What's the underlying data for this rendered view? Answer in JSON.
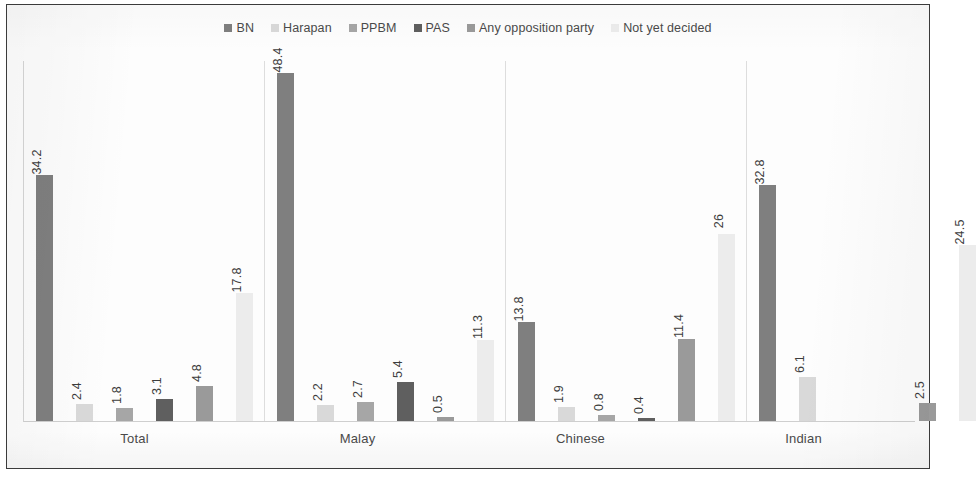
{
  "chart_data": {
    "type": "bar",
    "title": "",
    "subtitle": "",
    "xlabel": "",
    "ylabel": "",
    "grid": false,
    "legend_position": "top",
    "ylim": [
      0,
      50
    ],
    "categories": [
      "Total",
      "Malay",
      "Chinese",
      "Indian"
    ],
    "series": [
      {
        "name": "BN",
        "color": "#7f7f7f",
        "values": [
          34.2,
          48.4,
          13.8,
          32.8
        ]
      },
      {
        "name": "Harapan",
        "color": "#d9d9d9",
        "values": [
          2.4,
          2.2,
          1.9,
          6.1
        ]
      },
      {
        "name": "PPBM",
        "color": "#a6a6a6",
        "values": [
          1.8,
          2.7,
          0.8,
          0
        ]
      },
      {
        "name": "PAS",
        "color": "#5f5f5f",
        "values": [
          3.1,
          5.4,
          0.4,
          0
        ]
      },
      {
        "name": "Any opposition party",
        "color": "#9a9a9a",
        "values": [
          4.8,
          0.5,
          11.4,
          2.5
        ]
      },
      {
        "name": "Not yet decided",
        "color": "#ececec",
        "values": [
          17.8,
          11.3,
          26,
          24.5
        ]
      }
    ],
    "value_labels": [
      [
        "34.2",
        "2.4",
        "1.8",
        "3.1",
        "4.8",
        "17.8"
      ],
      [
        "48.4",
        "2.2",
        "2.7",
        "5.4",
        "0.5",
        "11.3"
      ],
      [
        "13.8",
        "1.9",
        "0.8",
        "0.4",
        "11.4",
        "26"
      ],
      [
        "32.8",
        "6.1",
        "",
        "",
        "2.5",
        "24.5"
      ]
    ]
  },
  "frame": {
    "border_color": "#3b3b3b",
    "background": "#fdfdfd"
  }
}
